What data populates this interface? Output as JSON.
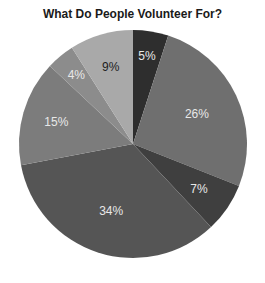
{
  "chart_data": {
    "type": "pie",
    "title": "What Do People Volunteer For?",
    "start_angle_deg": 0,
    "direction": "clockwise",
    "slices": [
      {
        "label": "5%",
        "value": 5,
        "color": "#2e2e2e",
        "label_color": "#e8e8e8"
      },
      {
        "label": "26%",
        "value": 26,
        "color": "#6f6f6f",
        "label_color": "#e8e8e8"
      },
      {
        "label": "7%",
        "value": 7,
        "color": "#3f3f3f",
        "label_color": "#e8e8e8"
      },
      {
        "label": "34%",
        "value": 34,
        "color": "#555555",
        "label_color": "#e8e8e8"
      },
      {
        "label": "15%",
        "value": 15,
        "color": "#7c7c7c",
        "label_color": "#e8e8e8"
      },
      {
        "label": "4%",
        "value": 4,
        "color": "#8c8c8c",
        "label_color": "#e8e8e8"
      },
      {
        "label": "9%",
        "value": 9,
        "color": "#a9a9a9",
        "label_color": "#1e1e1e"
      }
    ],
    "legend": "none"
  }
}
